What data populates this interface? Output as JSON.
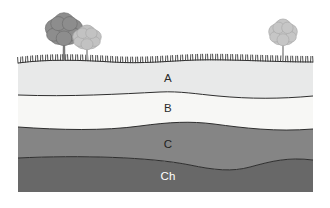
{
  "diagram": {
    "type": "soil-profile-cross-section",
    "frame": {
      "left": 18,
      "top": 58,
      "right": 313,
      "bottom": 192
    },
    "surface": {
      "name": "grass-surface",
      "label": "grass",
      "tick_color": "#3a3a3a",
      "tick_count": 118,
      "tick_height": 6
    },
    "horizons": [
      {
        "id": "A",
        "label": "A",
        "name": "horizon-a",
        "color": "#e8e9e9",
        "label_color": "#2b2b2b",
        "label_x": 168,
        "label_y": 82,
        "description": "topsoil horizon"
      },
      {
        "id": "B",
        "label": "B",
        "name": "horizon-b",
        "color": "#f7f7f5",
        "label_color": "#2b2b2b",
        "label_x": 168,
        "label_y": 112,
        "description": "subsoil horizon"
      },
      {
        "id": "C",
        "label": "C",
        "name": "horizon-c",
        "color": "#858585",
        "label_color": "#1f1f1f",
        "label_x": 168,
        "label_y": 148,
        "description": "parent material horizon"
      },
      {
        "id": "Ch",
        "label": "Ch",
        "name": "horizon-ch",
        "color": "#686868",
        "label_color": "#ffffff",
        "label_x": 168,
        "label_y": 180,
        "description": "bedrock horizon"
      }
    ],
    "boundary_color": "#2e2e2e",
    "trees": [
      {
        "name": "tree-left-front",
        "canopy_color": "#8d8d8d",
        "canopy_outline": "#6f6f6f",
        "trunk_color": "#7b7b7b",
        "center_x": 64,
        "canopy_y": 30,
        "canopy_rx": 17,
        "canopy_ry": 16,
        "trunk_top": 42,
        "trunk_bottom": 60
      },
      {
        "name": "tree-left-back",
        "canopy_color": "#c2c2c2",
        "canopy_outline": "#a9a9a9",
        "trunk_color": "#a8a8a8",
        "center_x": 87,
        "canopy_y": 38,
        "canopy_rx": 13,
        "canopy_ry": 12,
        "trunk_top": 47,
        "trunk_bottom": 60
      },
      {
        "name": "tree-right",
        "canopy_color": "#c6c6c6",
        "canopy_outline": "#ababab",
        "trunk_color": "#a8a8a8",
        "center_x": 283,
        "canopy_y": 33,
        "canopy_rx": 13,
        "canopy_ry": 13,
        "trunk_top": 43,
        "trunk_bottom": 60
      }
    ]
  }
}
